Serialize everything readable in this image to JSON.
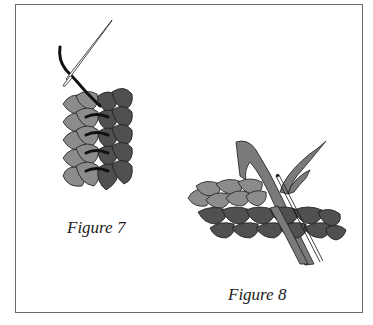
{
  "figures": [
    {
      "id": "figure-7",
      "caption": "Figure 7",
      "description": "Two braids stitched side by side vertically with needle and dark thread"
    },
    {
      "id": "figure-8",
      "caption": "Figure 8",
      "description": "Two horizontal braids joined with needle passing through strands"
    }
  ],
  "colors": {
    "light_braid": "#8c8c8c",
    "dark_braid": "#505050",
    "strand": "#7a7a7a",
    "outline": "#1a1a1a",
    "thread": "#1a1a1a",
    "border": "#6a6a6a"
  }
}
